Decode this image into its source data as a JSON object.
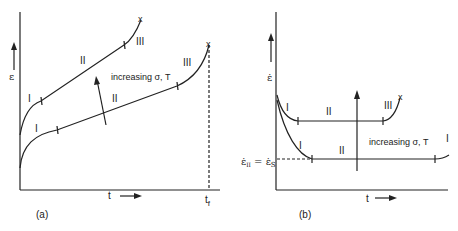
{
  "panel_a": {
    "caption": "(a)",
    "y_label": "ε",
    "x_label": "t",
    "tf_label": "t",
    "tf_sub": "f",
    "annotation": "increasing σ, T",
    "upper_curve": {
      "stage1": "I",
      "stage2": "II",
      "stage3": "III",
      "rupture": "x"
    },
    "lower_curve": {
      "stage1": "I",
      "stage2": "II",
      "stage3": "III",
      "rupture": "x"
    }
  },
  "panel_b": {
    "caption": "(b)",
    "y_label": "ε̇",
    "x_label": "t",
    "steady_label": "ε̇",
    "steady_sub_left": "II",
    "steady_eq": " = ε̇",
    "steady_sub_right": "S",
    "annotation": "increasing σ, T",
    "upper_curve": {
      "stage1": "I",
      "stage2": "II",
      "stage3": "III",
      "rupture": "x"
    },
    "lower_curve": {
      "stage1": "I",
      "stage2": "II",
      "stage3": "I"
    }
  }
}
